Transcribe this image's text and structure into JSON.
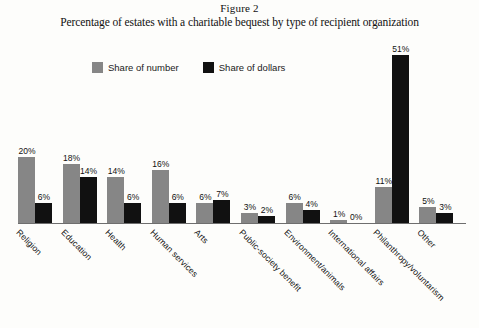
{
  "figure": {
    "number_label": "Figure 2",
    "title": "Percentage of estates with a charitable bequest by type of recipient organization"
  },
  "legend": {
    "position": "top-left",
    "items": [
      {
        "label": "Share of number",
        "color": "#868686",
        "swatch": "legend-swatch-share-of-number"
      },
      {
        "label": "Share of dollars",
        "color": "#111111",
        "swatch": "legend-swatch-share-of-dollars"
      }
    ]
  },
  "axis": {
    "baseline_color": "#6e6e6e",
    "y_max_percent": 55,
    "grid": false,
    "y_axis_visible": false
  },
  "chart_data": {
    "type": "bar",
    "title": "Percentage of estates with a charitable bequest by type of recipient organization",
    "subtitle": "Figure 2",
    "xlabel": "",
    "ylabel": "",
    "ylim": [
      0,
      55
    ],
    "grid": false,
    "legend_position": "top-left",
    "value_format": "percent",
    "categories": [
      "Religion",
      "Education",
      "Health",
      "Human services",
      "Arts",
      "Public-society benefit",
      "Environment/animals",
      "International affairs",
      "Philanthropy/voluntarism",
      "Other"
    ],
    "series": [
      {
        "name": "Share of number",
        "color": "#868686",
        "values": [
          20,
          18,
          14,
          16,
          6,
          3,
          6,
          1,
          11,
          5
        ],
        "labels": [
          "20%",
          "18%",
          "14%",
          "16%",
          "6%",
          "3%",
          "6%",
          "1%",
          "11%",
          "5%"
        ]
      },
      {
        "name": "Share of dollars",
        "color": "#111111",
        "values": [
          6,
          14,
          6,
          6,
          7,
          2,
          4,
          0,
          51,
          3
        ],
        "labels": [
          "6%",
          "14%",
          "6%",
          "6%",
          "7%",
          "2%",
          "4%",
          "0%",
          "51%",
          "3%"
        ]
      }
    ]
  }
}
